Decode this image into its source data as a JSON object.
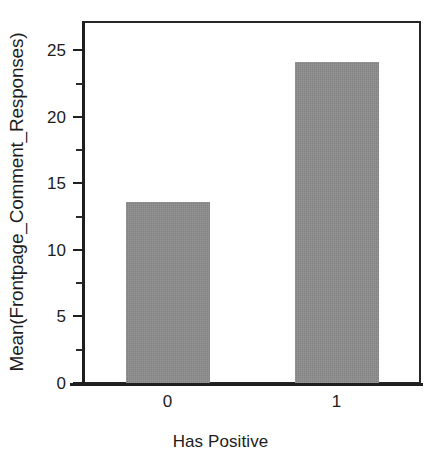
{
  "chart_data": {
    "type": "bar",
    "title": "",
    "xlabel": "Has Positive",
    "ylabel": "Mean(Frontpage_Comment_Responses)",
    "categories": [
      "0",
      "1"
    ],
    "values": [
      13.6,
      24.1
    ],
    "ylim": [
      0,
      27.2
    ],
    "y_major_ticks": [
      0,
      5,
      10,
      15,
      20,
      25
    ],
    "y_minor_ticks": [
      2.5,
      7.5,
      12.5,
      17.5,
      22.5,
      27.5
    ],
    "y_tick_labels": [
      "0",
      "5",
      "10",
      "15",
      "20",
      "25"
    ],
    "x_tick_labels": [
      "0",
      "1"
    ],
    "grid": false,
    "legend": false,
    "legend_position": "none",
    "bar_color": "#8c8c8c",
    "axis_color": "#1f1f1f",
    "background_color": "#ffffff"
  },
  "axes": {
    "y_title": "Mean(Frontpage_Comment_Responses)",
    "x_title": "Has Positive"
  }
}
